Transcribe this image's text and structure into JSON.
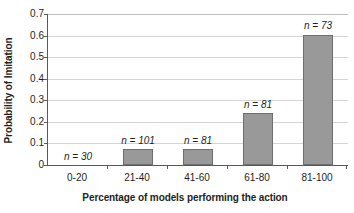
{
  "chart_data": {
    "type": "bar",
    "title": "",
    "subtitle": "",
    "xlabel": "Percentage of models performing the action",
    "ylabel": "Probability of Imitation",
    "categories": [
      "0-20",
      "21-40",
      "41-60",
      "61-80",
      "81-100"
    ],
    "values": [
      0,
      0.072,
      0.075,
      0.24,
      0.605
    ],
    "annotations": [
      "n = 30",
      "n = 101",
      "n = 81",
      "n = 81",
      "n = 73"
    ],
    "sample_sizes": [
      30,
      101,
      81,
      81,
      73
    ],
    "ylim": [
      0,
      0.7
    ],
    "ytick_labels": [
      "0",
      "0.1",
      "0.2",
      "0.3",
      "0.4",
      "0.5",
      "0.6",
      "0.7"
    ],
    "ytick_values": [
      0,
      0.1,
      0.2,
      0.3,
      0.4,
      0.5,
      0.6,
      0.7
    ],
    "grid": "horizontal",
    "legend": "none",
    "bar_color": "#999999",
    "bar_border_color": "#6d6e71",
    "gridline_color": "#d4d4d4",
    "axis_color": "#58595b",
    "text_color": "#231f20",
    "background": "#ffffff"
  }
}
